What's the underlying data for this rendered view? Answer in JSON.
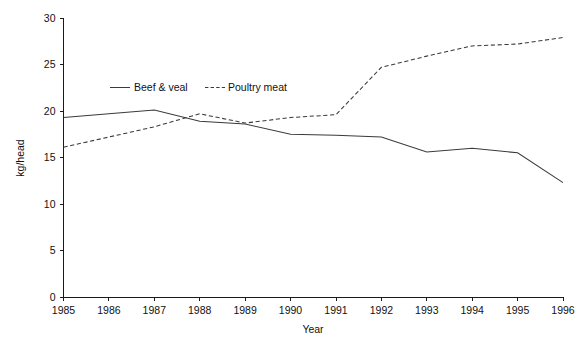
{
  "chart_data": {
    "type": "line",
    "title": "",
    "xlabel": "Year",
    "ylabel": "kg/head",
    "x": [
      1985,
      1986,
      1987,
      1988,
      1989,
      1990,
      1991,
      1992,
      1993,
      1994,
      1995,
      1996
    ],
    "categories": [
      "1985",
      "1986",
      "1987",
      "1988",
      "1989",
      "1990",
      "1991",
      "1992",
      "1993",
      "1994",
      "1995",
      "1996"
    ],
    "xlim": [
      1985,
      1996
    ],
    "ylim": [
      0,
      30
    ],
    "yticks": [
      0,
      5,
      10,
      15,
      20,
      25,
      30
    ],
    "ytick_labels": [
      "0",
      "5",
      "10",
      "15",
      "20",
      "25",
      "30"
    ],
    "xticks": [
      1985,
      1986,
      1987,
      1988,
      1989,
      1990,
      1991,
      1992,
      1993,
      1994,
      1995,
      1996
    ],
    "xtick_labels": [
      "1985",
      "1986",
      "1987",
      "1988",
      "1989",
      "1990",
      "1991",
      "1992",
      "1993",
      "1994",
      "1995",
      "1996"
    ],
    "grid": false,
    "legend_position": "upper-left-inside",
    "series": [
      {
        "name": "Beef & veal",
        "style": "solid",
        "color": "#3a3a3a",
        "values": [
          19.3,
          19.7,
          20.1,
          18.9,
          18.6,
          17.5,
          17.4,
          17.2,
          15.6,
          16.0,
          15.5,
          12.3
        ]
      },
      {
        "name": "Poultry meat",
        "style": "dashed",
        "color": "#3a3a3a",
        "values": [
          16.1,
          17.2,
          18.3,
          19.7,
          18.7,
          19.3,
          19.6,
          24.7,
          25.9,
          27.0,
          27.2,
          27.9
        ]
      }
    ]
  },
  "legend": {
    "items": [
      {
        "label": "Beef & veal",
        "style": "solid"
      },
      {
        "label": "Poultry meat",
        "style": "dashed"
      }
    ]
  },
  "axes": {
    "x_title": "Year",
    "y_title": "kg/head"
  },
  "colors": {
    "background": "#ffffff",
    "axis": "#1a1a1a",
    "series": "#3a3a3a",
    "text": "#111111"
  }
}
